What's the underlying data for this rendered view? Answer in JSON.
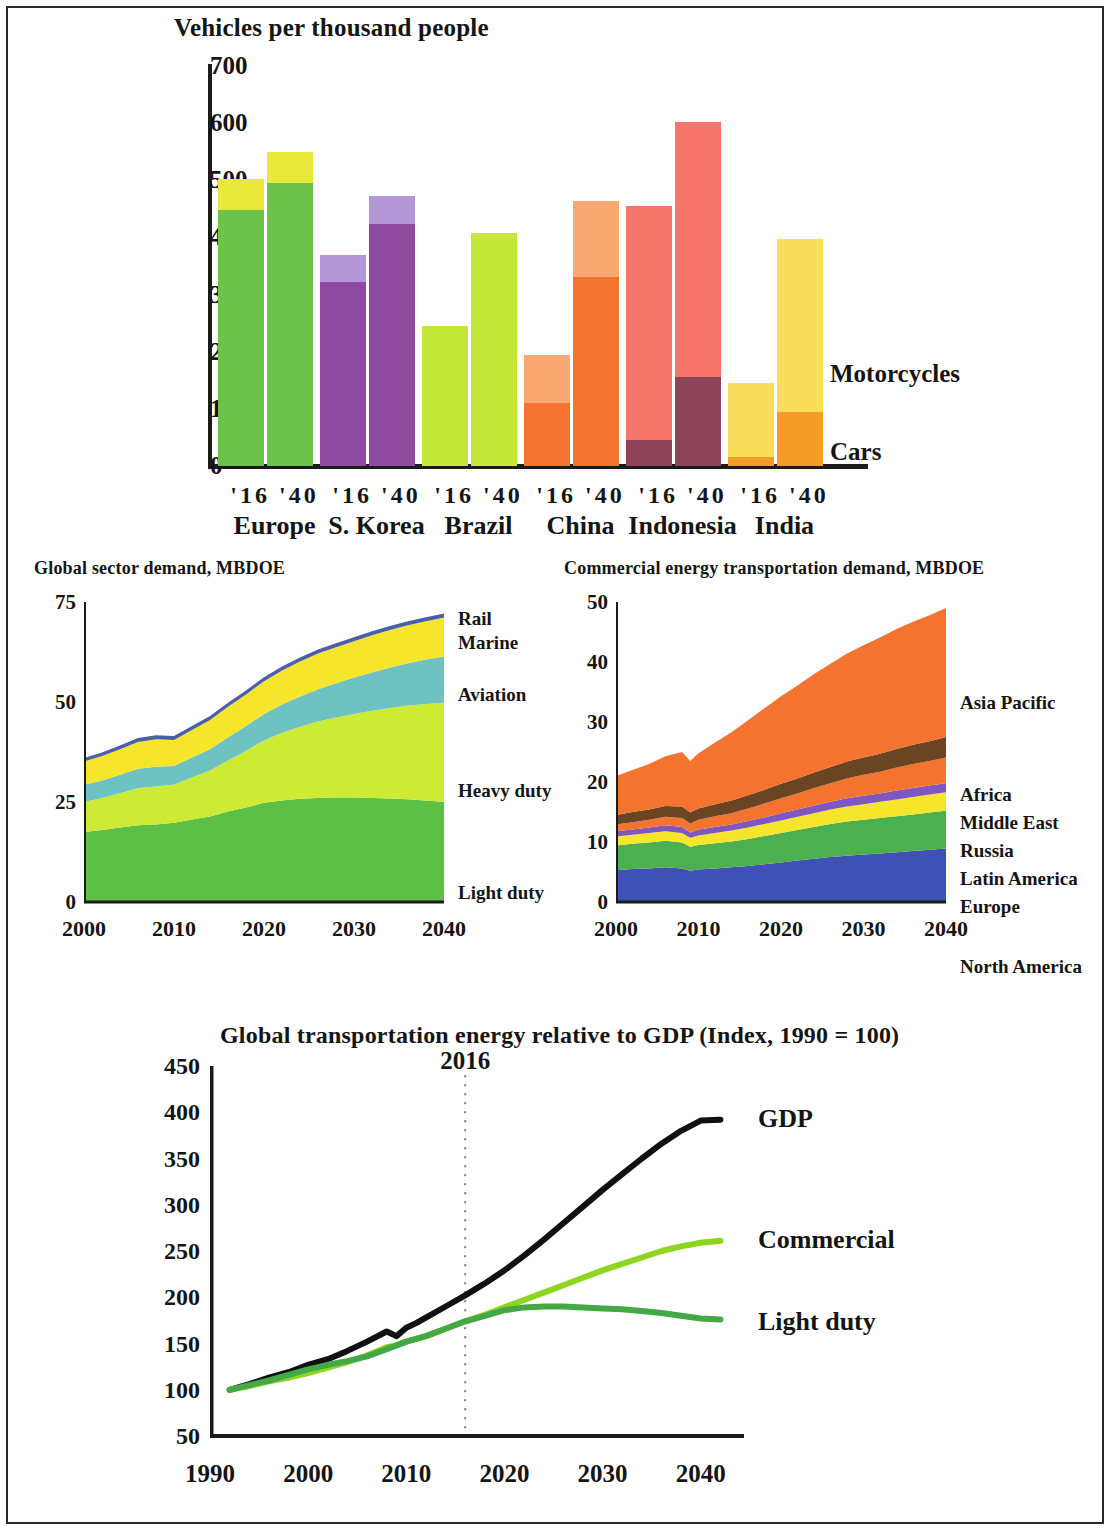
{
  "chart_data": [
    {
      "type": "bar",
      "title": "Vehicles per thousand people",
      "ylabel": "",
      "xlabel": "",
      "ylim": [
        0,
        700
      ],
      "yticks": [
        0,
        100,
        200,
        300,
        400,
        500,
        600,
        700
      ],
      "grid": false,
      "legend_position": "right",
      "stacked": true,
      "series": [
        {
          "name": "Cars",
          "color": "#f0941f",
          "values": [
            448,
            495,
            322,
            424,
            245,
            408,
            110,
            330,
            45,
            155,
            15,
            95
          ]
        },
        {
          "name": "Motorcycles",
          "color": "#fae45f",
          "values": [
            54,
            54,
            47,
            48,
            0,
            0,
            85,
            133,
            410,
            447,
            130,
            303
          ]
        }
      ],
      "categories": [
        {
          "region": "Europe",
          "year_labels": [
            "'16",
            "'40"
          ],
          "car_color": "#6cc24a",
          "moto_color": "#e9e93b",
          "totals": [
            502,
            549
          ],
          "cars": [
            448,
            495
          ],
          "motorcycles": [
            54,
            54
          ]
        },
        {
          "region": "S. Korea",
          "year_labels": [
            "'16",
            "'40"
          ],
          "car_color": "#8e4a9e",
          "moto_color": "#b396d6",
          "totals": [
            369,
            472
          ],
          "cars": [
            322,
            424
          ],
          "motorcycles": [
            47,
            48
          ]
        },
        {
          "region": "Brazil",
          "year_labels": [
            "'16",
            "'40"
          ],
          "car_color": "#c4e739",
          "moto_color": "#c4e739",
          "totals": [
            245,
            408
          ],
          "cars": [
            245,
            408
          ],
          "motorcycles": [
            0,
            0
          ]
        },
        {
          "region": "China",
          "year_labels": [
            "'16",
            "'40"
          ],
          "car_color": "#f4732f",
          "moto_color": "#f9a871",
          "totals": [
            195,
            463
          ],
          "cars": [
            110,
            330
          ],
          "motorcycles": [
            85,
            133
          ]
        },
        {
          "region": "Indonesia",
          "year_labels": [
            "'16",
            "'40"
          ],
          "car_color": "#8d4458",
          "moto_color": "#f6766b",
          "totals": [
            455,
            602
          ],
          "cars": [
            45,
            155
          ],
          "motorcycles": [
            410,
            447
          ]
        },
        {
          "region": "India",
          "year_labels": [
            "'16",
            "'40"
          ],
          "car_color": "#f59b28",
          "moto_color": "#f9de5c",
          "totals": [
            145,
            398
          ],
          "cars": [
            15,
            95
          ],
          "motorcycles": [
            130,
            303
          ]
        }
      ],
      "legend": [
        {
          "label": "Motorcycles"
        },
        {
          "label": "Cars"
        }
      ]
    },
    {
      "type": "area",
      "title": "Global sector demand, MBDOE",
      "ylim": [
        0,
        75
      ],
      "yticks": [
        0,
        25,
        50,
        75
      ],
      "xticks": [
        2000,
        2010,
        2020,
        2030,
        2040
      ],
      "xlim": [
        2000,
        2040
      ],
      "grid": false,
      "legend_position": "right",
      "stacked": true,
      "x": [
        2000,
        2002,
        2004,
        2006,
        2008,
        2010,
        2012,
        2014,
        2016,
        2018,
        2020,
        2022,
        2024,
        2026,
        2028,
        2030,
        2032,
        2034,
        2036,
        2038,
        2040
      ],
      "series": [
        {
          "name": "Light duty",
          "color": "#5cbf46",
          "values": [
            17.5,
            18.0,
            18.6,
            19.2,
            19.4,
            19.8,
            20.6,
            21.4,
            22.6,
            23.6,
            24.8,
            25.4,
            25.8,
            26.0,
            26.1,
            26.1,
            26.0,
            25.9,
            25.7,
            25.4,
            25.0
          ]
        },
        {
          "name": "Heavy duty",
          "color": "#cdeb35",
          "values": [
            7.5,
            8.0,
            8.6,
            9.3,
            9.5,
            9.6,
            10.5,
            11.5,
            12.8,
            14.2,
            15.6,
            16.9,
            18.0,
            19.1,
            20.0,
            20.9,
            21.8,
            22.6,
            23.4,
            24.1,
            24.8
          ]
        },
        {
          "name": "Aviation",
          "color": "#6fc2c2",
          "values": [
            4.3,
            4.4,
            4.6,
            4.8,
            4.9,
            4.6,
            5.0,
            5.3,
            5.8,
            6.2,
            6.6,
            7.1,
            7.6,
            8.1,
            8.6,
            9.1,
            9.6,
            10.1,
            10.6,
            11.1,
            11.6
          ]
        },
        {
          "name": "Marine",
          "color": "#f5e62c",
          "values": [
            5.8,
            6.1,
            6.4,
            6.7,
            6.9,
            6.5,
            6.9,
            7.3,
            7.6,
            7.9,
            8.2,
            8.5,
            8.7,
            8.9,
            9.0,
            9.1,
            9.3,
            9.4,
            9.5,
            9.6,
            9.7
          ]
        },
        {
          "name": "Rail",
          "color": "#4a5fa8",
          "values": [
            0.9,
            0.9,
            0.9,
            1.0,
            1.0,
            1.0,
            1.0,
            1.0,
            1.0,
            1.0,
            1.0,
            1.0,
            1.0,
            1.0,
            1.0,
            1.0,
            1.0,
            1.0,
            1.0,
            1.0,
            1.0
          ]
        }
      ],
      "legend": [
        {
          "label": "Rail"
        },
        {
          "label": "Marine"
        },
        {
          "label": "Aviation"
        },
        {
          "label": "Heavy duty"
        },
        {
          "label": "Light duty"
        }
      ]
    },
    {
      "type": "area",
      "title": "Commercial energy transportation demand, MBDOE",
      "ylim": [
        0,
        50
      ],
      "yticks": [
        0,
        10,
        20,
        30,
        40,
        50
      ],
      "xticks": [
        2000,
        2010,
        2020,
        2030,
        2040
      ],
      "xlim": [
        2000,
        2040
      ],
      "grid": false,
      "legend_position": "right",
      "stacked": true,
      "x": [
        2000,
        2002,
        2004,
        2006,
        2008,
        2009,
        2010,
        2012,
        2014,
        2016,
        2018,
        2020,
        2022,
        2024,
        2026,
        2028,
        2030,
        2032,
        2034,
        2036,
        2038,
        2040
      ],
      "series": [
        {
          "name": "North America",
          "color": "#3f51b5",
          "values": [
            5.3,
            5.5,
            5.6,
            5.8,
            5.6,
            5.2,
            5.4,
            5.6,
            5.8,
            6.0,
            6.3,
            6.6,
            6.9,
            7.2,
            7.5,
            7.7,
            7.9,
            8.1,
            8.3,
            8.5,
            8.7,
            8.9
          ]
        },
        {
          "name": "Europe",
          "color": "#4caf50",
          "values": [
            4.1,
            4.2,
            4.3,
            4.4,
            4.3,
            4.0,
            4.1,
            4.2,
            4.3,
            4.5,
            4.7,
            4.9,
            5.1,
            5.3,
            5.5,
            5.7,
            5.8,
            5.9,
            6.0,
            6.1,
            6.2,
            6.3
          ]
        },
        {
          "name": "Latin America",
          "color": "#f5e62c",
          "values": [
            1.5,
            1.5,
            1.6,
            1.6,
            1.6,
            1.5,
            1.6,
            1.7,
            1.8,
            1.9,
            2.0,
            2.1,
            2.2,
            2.3,
            2.4,
            2.5,
            2.6,
            2.7,
            2.8,
            2.9,
            3.0,
            3.1
          ]
        },
        {
          "name": "Russia",
          "color": "#7e57c2",
          "values": [
            0.9,
            0.9,
            0.9,
            1.0,
            1.0,
            0.9,
            1.0,
            1.0,
            1.0,
            1.1,
            1.1,
            1.2,
            1.2,
            1.3,
            1.3,
            1.4,
            1.4,
            1.4,
            1.5,
            1.5,
            1.5,
            1.5
          ]
        },
        {
          "name": "Middle East",
          "color": "#f4732f",
          "values": [
            1.1,
            1.2,
            1.3,
            1.4,
            1.5,
            1.5,
            1.6,
            1.8,
            1.9,
            2.1,
            2.3,
            2.5,
            2.7,
            2.9,
            3.1,
            3.3,
            3.5,
            3.6,
            3.8,
            4.0,
            4.1,
            4.3
          ]
        },
        {
          "name": "Africa",
          "color": "#6b4423",
          "values": [
            1.6,
            1.7,
            1.7,
            1.8,
            1.9,
            1.8,
            1.9,
            2.0,
            2.1,
            2.2,
            2.3,
            2.4,
            2.5,
            2.6,
            2.7,
            2.8,
            2.9,
            3.0,
            3.1,
            3.2,
            3.3,
            3.4
          ]
        },
        {
          "name": "Asia Pacific",
          "color": "#f4732f",
          "values": [
            6.5,
            7.0,
            7.6,
            8.3,
            9.1,
            8.6,
            9.2,
            10.3,
            11.4,
            12.5,
            13.6,
            14.6,
            15.5,
            16.4,
            17.2,
            18.0,
            18.7,
            19.4,
            20.0,
            20.5,
            21.0,
            21.5
          ]
        }
      ],
      "legend": [
        {
          "label": "Asia Pacific"
        },
        {
          "label": "Africa"
        },
        {
          "label": "Middle East"
        },
        {
          "label": "Russia"
        },
        {
          "label": "Latin America"
        },
        {
          "label": "Europe"
        },
        {
          "label": "North America"
        }
      ]
    },
    {
      "type": "line",
      "title": "Global transportation energy relative to GDP (Index, 1990 = 100)",
      "ylim": [
        50,
        450
      ],
      "yticks": [
        50,
        100,
        150,
        200,
        250,
        300,
        350,
        400,
        450
      ],
      "xticks": [
        1990,
        2000,
        2010,
        2020,
        2030,
        2040
      ],
      "xlim": [
        1990,
        2044
      ],
      "grid": false,
      "legend_position": "right",
      "annotations": [
        {
          "label": "2016",
          "x": 2016,
          "style": "dotted-vertical"
        }
      ],
      "x": [
        1992,
        1994,
        1996,
        1998,
        2000,
        2002,
        2004,
        2006,
        2008,
        2009,
        2010,
        2011,
        2012,
        2014,
        2016,
        2018,
        2020,
        2022,
        2024,
        2026,
        2028,
        2030,
        2032,
        2034,
        2036,
        2038,
        2040,
        2042
      ],
      "series": [
        {
          "name": "GDP",
          "color": "#111111",
          "values": [
            100,
            106,
            113,
            119,
            127,
            133,
            142,
            152,
            163,
            158,
            167,
            172,
            178,
            190,
            202,
            215,
            229,
            245,
            262,
            280,
            298,
            316,
            333,
            350,
            366,
            380,
            391,
            392
          ]
        },
        {
          "name": "Commercial",
          "color": "#8ed51f",
          "values": [
            100,
            104,
            109,
            113,
            118,
            124,
            130,
            137,
            146,
            148,
            152,
            155,
            158,
            166,
            174,
            181,
            189,
            197,
            205,
            213,
            221,
            229,
            236,
            243,
            250,
            255,
            259,
            261
          ]
        },
        {
          "name": "Light duty",
          "color": "#44a846",
          "values": [
            100,
            105,
            110,
            116,
            122,
            127,
            131,
            136,
            144,
            148,
            152,
            155,
            158,
            166,
            174,
            180,
            186,
            189,
            190,
            190,
            189,
            188,
            187,
            185,
            183,
            180,
            177,
            176
          ]
        }
      ],
      "legend": [
        {
          "label": "GDP"
        },
        {
          "label": "Commercial"
        },
        {
          "label": "Light duty"
        }
      ]
    }
  ]
}
